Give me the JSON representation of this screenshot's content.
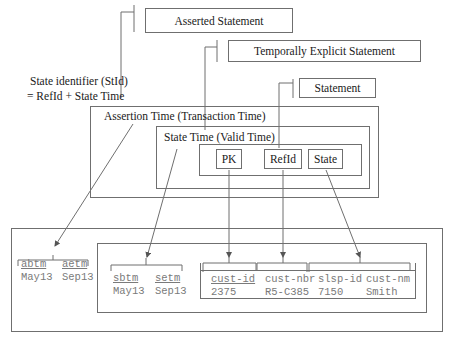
{
  "diagram": {
    "labels": {
      "asserted_statement": "Asserted Statement",
      "temporally_explicit_statement": "Temporally Explicit Statement",
      "statement": "Statement",
      "state_identifier_line1": "State identifier (StId)",
      "state_identifier_line2": "= RefId + State Time",
      "assertion_time": "Assertion Time (Transaction Time)",
      "state_time": "State Time (Valid Time)",
      "pk": "PK",
      "refid": "RefId",
      "state": "State"
    },
    "table": {
      "assertion_cols": [
        {
          "header": "abtm",
          "value": "May13"
        },
        {
          "header": "aetm",
          "value": "Sep13"
        }
      ],
      "state_cols": [
        {
          "header": "sbtm",
          "value": "May13"
        },
        {
          "header": "setm",
          "value": "Sep13"
        }
      ],
      "data_cols": [
        {
          "header": "cust-id",
          "value": "2375",
          "underlined": true
        },
        {
          "header": "cust-nbr",
          "value": "R5-C385",
          "underlined": false
        },
        {
          "header": "slsp-id",
          "value": "7150",
          "underlined": false
        },
        {
          "header": "cust-nm",
          "value": "Smith",
          "underlined": false
        }
      ]
    },
    "colors": {
      "line": "#6f6f6f",
      "text": "#1a1a1a",
      "mono_text": "#7a7a7a"
    }
  }
}
